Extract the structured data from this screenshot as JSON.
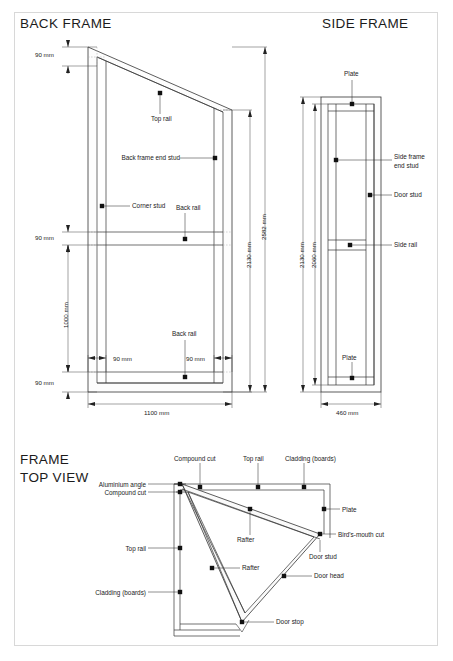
{
  "sheet": {
    "background": "#ffffff",
    "line_color": "#333333",
    "border_color": "#d8d8d8",
    "fill_color": "#f4f4f4"
  },
  "titles": {
    "back_frame": "BACK FRAME",
    "side_frame": "SIDE FRAME",
    "frame_top_view_line1": "FRAME",
    "frame_top_view_line2": "TOP VIEW"
  },
  "back_frame": {
    "labels": {
      "top_rail": "Top rail",
      "back_frame_end_stud": "Back frame end stud",
      "corner_stud": "Corner stud",
      "back_rail_upper": "Back rail",
      "back_rail_lower": "Back rail"
    },
    "dimensions": {
      "top_90": "90 mm",
      "mid_90": "90 mm",
      "bottom_90": "90 mm",
      "height_1000": "1000 mm",
      "height_2130": "2130 mm",
      "height_2582": "2582 mm",
      "width_90_left": "90 mm",
      "width_90_right": "90 mm",
      "width_1100": "1100 mm"
    }
  },
  "side_frame": {
    "labels": {
      "plate_top": "Plate",
      "side_frame_end_stud": "Side frame\nend stud",
      "door_stud": "Door stud",
      "side_rail": "Side rail",
      "plate_bottom": "Plate"
    },
    "dimensions": {
      "height_2130": "2130 mm",
      "height_2060": "2060 mm",
      "width_460": "460 mm"
    }
  },
  "top_view": {
    "labels": {
      "compound_cut_top": "Compound cut",
      "top_rail_top": "Top rail",
      "cladding_top": "Cladding (boards)",
      "aluminium_angle": "Aluminium angle",
      "compound_cut_left": "Compound cut",
      "top_rail_left": "Top rail",
      "cladding_left": "Cladding (boards)",
      "plate": "Plate",
      "rafter_upper": "Rafter",
      "rafter_lower": "Rafter",
      "birds_mouth_cut": "Bird's-mouth cut",
      "door_stud": "Door stud",
      "door_head": "Door head",
      "door_stop": "Door stop"
    }
  }
}
